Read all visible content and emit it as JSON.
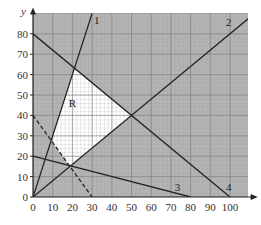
{
  "chart_data": {
    "type": "line",
    "title": "",
    "xlabel": "x",
    "ylabel": "y",
    "xlim": [
      0,
      110
    ],
    "ylim": [
      0,
      90
    ],
    "x_ticks": [
      0,
      10,
      20,
      30,
      40,
      50,
      60,
      70,
      80,
      90,
      100
    ],
    "y_ticks": [
      0,
      10,
      20,
      30,
      40,
      50,
      60,
      70,
      80
    ],
    "grid": true,
    "lines": [
      {
        "name": "1",
        "style": "solid",
        "points": [
          [
            0,
            0
          ],
          [
            30,
            90
          ]
        ]
      },
      {
        "name": "2",
        "style": "solid",
        "points": [
          [
            0,
            0
          ],
          [
            110,
            88
          ]
        ]
      },
      {
        "name": "3",
        "style": "solid",
        "points": [
          [
            0,
            20
          ],
          [
            80,
            0
          ]
        ]
      },
      {
        "name": "4",
        "style": "solid",
        "points": [
          [
            0,
            80
          ],
          [
            100,
            0
          ]
        ]
      },
      {
        "name": "dashed",
        "style": "dashed",
        "points": [
          [
            0,
            40
          ],
          [
            30,
            0
          ]
        ]
      }
    ],
    "region": {
      "label": "R",
      "label_position": [
        20,
        44
      ],
      "vertices": [
        [
          9.2,
          27.7
        ],
        [
          21,
          63
        ],
        [
          50,
          40
        ],
        [
          18.75,
          15
        ]
      ],
      "fill": "unshaded (white)"
    },
    "shaded_color": "#b4b4b4",
    "annotations": [
      "1",
      "2",
      "3",
      "4",
      "R"
    ]
  }
}
